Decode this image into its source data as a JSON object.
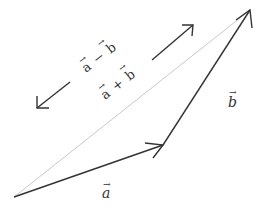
{
  "diagram": {
    "type": "vector-addition-triangle",
    "colors": {
      "vector_stroke": "#333333",
      "resultant_stroke": "#c8c8c8",
      "label": "#333333",
      "background": "#ffffff"
    },
    "vectors": [
      {
        "id": "a",
        "label": "a",
        "from": [
          14,
          197
        ],
        "to": [
          163,
          145
        ]
      },
      {
        "id": "b",
        "label": "b",
        "from": [
          163,
          145
        ],
        "to": [
          250,
          10
        ]
      },
      {
        "id": "a_plus_b",
        "label": "a + b",
        "from": [
          14,
          197
        ],
        "to": [
          250,
          10
        ]
      }
    ],
    "labels": {
      "a": "a",
      "b": "b",
      "sum": "a + b",
      "diff": "a − b",
      "sum_a": "a",
      "sum_op": "+",
      "sum_b": "b",
      "diff_a": "a",
      "diff_op": "−",
      "diff_b": "b"
    },
    "direction_arrows": [
      {
        "id": "sum-direction",
        "meaning": "a + b",
        "from": [
          152,
          60
        ],
        "to": [
          193,
          25
        ]
      },
      {
        "id": "diff-direction",
        "meaning": "a − b",
        "from": [
          70,
          82
        ],
        "to": [
          37,
          108
        ]
      }
    ]
  }
}
